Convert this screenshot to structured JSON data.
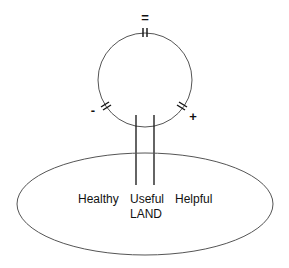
{
  "diagram": {
    "loop": {
      "markers": {
        "top": "=",
        "left": "-",
        "right": "+"
      }
    },
    "land": {
      "words": [
        "Healthy",
        "Useful",
        "Helpful"
      ],
      "label": "LAND"
    },
    "colors": {
      "stroke": "#555555",
      "bar": "#111111",
      "text": "#111111"
    }
  }
}
